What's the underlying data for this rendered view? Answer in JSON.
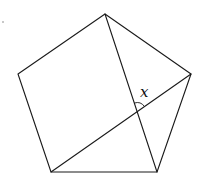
{
  "diagram": {
    "type": "regular-pentagon-with-diagonals",
    "stroke_color": "#1a1a1a",
    "background": "#ffffff",
    "vertices": {
      "top": [
        105,
        14
      ],
      "right": [
        191,
        74
      ],
      "bottom_right": [
        157,
        172
      ],
      "bottom_left": [
        51,
        172
      ],
      "left": [
        18,
        74
      ]
    },
    "diagonals": [
      {
        "from": "top",
        "to": "bottom_right"
      },
      {
        "from": "bottom_left",
        "to": "right"
      }
    ],
    "intersection": [
      137,
      112
    ],
    "angle_label": "x"
  }
}
